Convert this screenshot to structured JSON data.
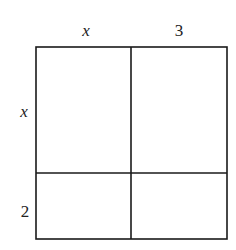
{
  "diagram": {
    "type": "area-model",
    "top_labels": [
      "x",
      "3"
    ],
    "left_labels": [
      "x",
      "2"
    ],
    "grid": {
      "rows": 2,
      "cols": 2
    },
    "cells": [
      [
        "",
        ""
      ],
      [
        "",
        ""
      ]
    ],
    "line_color": "#1a1a1a"
  }
}
